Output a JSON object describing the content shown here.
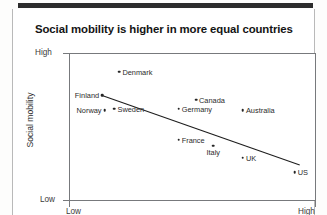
{
  "chart_data": {
    "type": "scatter",
    "title": "Social mobility is higher in more equal countries",
    "xlabel": "",
    "ylabel": "Social mobility",
    "x_tick_labels": [
      "Low",
      "High"
    ],
    "y_tick_labels": [
      "Low",
      "High"
    ],
    "xlim": [
      "Low",
      "High"
    ],
    "ylim": [
      "Low",
      "High"
    ],
    "grid": false,
    "legend": "none",
    "trendline": {
      "present": true,
      "direction": "negative",
      "start": {
        "x": 0.13,
        "y": 0.72
      },
      "end": {
        "x": 0.93,
        "y": 0.25
      }
    },
    "points": [
      {
        "name": "Denmark",
        "x": 0.2,
        "y": 0.88,
        "label_side": "right"
      },
      {
        "name": "Finland",
        "x": 0.13,
        "y": 0.72,
        "label_side": "left"
      },
      {
        "name": "Norway",
        "x": 0.14,
        "y": 0.62,
        "label_side": "left"
      },
      {
        "name": "Sweden",
        "x": 0.18,
        "y": 0.63,
        "label_side": "right"
      },
      {
        "name": "Canada",
        "x": 0.51,
        "y": 0.69,
        "label_side": "right"
      },
      {
        "name": "Germany",
        "x": 0.44,
        "y": 0.63,
        "label_side": "right"
      },
      {
        "name": "Australia",
        "x": 0.7,
        "y": 0.62,
        "label_side": "right"
      },
      {
        "name": "France",
        "x": 0.44,
        "y": 0.42,
        "label_side": "right"
      },
      {
        "name": "Italy",
        "x": 0.58,
        "y": 0.38,
        "label_side": "below"
      },
      {
        "name": "UK",
        "x": 0.7,
        "y": 0.3,
        "label_side": "right"
      },
      {
        "name": "US",
        "x": 0.91,
        "y": 0.2,
        "label_side": "right"
      }
    ]
  },
  "axes": {
    "y_high_label": "High",
    "y_low_label": "Low",
    "x_low_label": "Low",
    "x_high_label": "High",
    "y_title": "Social mobility",
    "x_title": ""
  },
  "colors": {
    "point": "#252525",
    "frame": "#77797c",
    "title": "#141414",
    "trendline": "#1d1d1d"
  }
}
